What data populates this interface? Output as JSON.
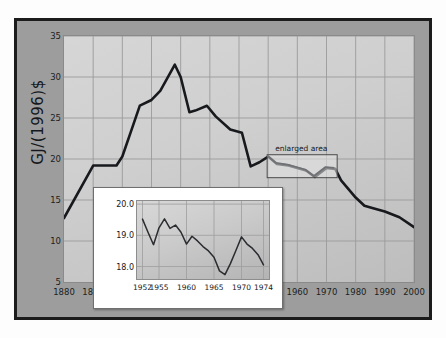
{
  "figure": {
    "title": "energy intensity of the US economy",
    "ylabel": "GJ/(1996)$",
    "callout_label": "enlarged area"
  },
  "chart_data": {
    "type": "line",
    "title": "energy intensity of the US economy",
    "xlabel": "",
    "ylabel": "GJ/(1996)$",
    "xlim": [
      1880,
      2000
    ],
    "ylim": [
      5,
      35
    ],
    "xticks": [
      1880,
      1890,
      1900,
      1910,
      1920,
      1930,
      1940,
      1950,
      1960,
      1970,
      1980,
      1990,
      2000
    ],
    "yticks": [
      5,
      10,
      15,
      20,
      25,
      30,
      35
    ],
    "grid": true,
    "legend": null,
    "series": [
      {
        "name": "energy intensity",
        "x": [
          1880,
          1890,
          1898,
          1900,
          1903,
          1906,
          1910,
          1913,
          1918,
          1920,
          1923,
          1925,
          1929,
          1932,
          1937,
          1941,
          1944,
          1947,
          1950,
          1953,
          1957,
          1960,
          1963,
          1966,
          1970,
          1973,
          1975,
          1980,
          1983,
          1986,
          1990,
          1995,
          2000
        ],
        "values": [
          12.8,
          19.2,
          19.2,
          20.3,
          23.4,
          26.5,
          27.2,
          28.3,
          31.5,
          30.0,
          25.7,
          25.9,
          26.5,
          25.2,
          23.6,
          23.2,
          19.1,
          19.6,
          20.3,
          19.4,
          19.2,
          18.9,
          18.6,
          17.8,
          18.9,
          18.8,
          17.4,
          15.3,
          14.3,
          14.0,
          13.6,
          12.9,
          11.7
        ]
      }
    ],
    "inset": {
      "type": "line",
      "xlim": [
        1951,
        1975
      ],
      "ylim": [
        17.6,
        20.1
      ],
      "xticks": [
        1952,
        1955,
        1960,
        1965,
        1970,
        1974
      ],
      "yticks": [
        18.0,
        19.0,
        20.0
      ],
      "ytick_labels": [
        "18.0",
        "19.0",
        "20.0"
      ],
      "xtick_labels": [
        "1952",
        "1955",
        "1960",
        "1965",
        "1970",
        "1974"
      ],
      "grid": true,
      "series": [
        {
          "name": "energy intensity (1952-1974)",
          "x": [
            1952,
            1953,
            1954,
            1955,
            1956,
            1957,
            1958,
            1959,
            1960,
            1961,
            1962,
            1963,
            1964,
            1965,
            1966,
            1967,
            1968,
            1969,
            1970,
            1971,
            1972,
            1973,
            1974
          ],
          "values": [
            19.52,
            19.1,
            18.7,
            19.24,
            19.53,
            19.22,
            19.33,
            19.1,
            18.72,
            18.97,
            18.82,
            18.64,
            18.5,
            18.3,
            17.86,
            17.74,
            18.1,
            18.52,
            18.95,
            18.72,
            18.58,
            18.38,
            18.05
          ]
        }
      ]
    },
    "annotations": [
      {
        "text": "enlarged area",
        "x_range": [
          1950,
          1974
        ],
        "y_range": [
          17.6,
          20.4
        ]
      }
    ]
  }
}
